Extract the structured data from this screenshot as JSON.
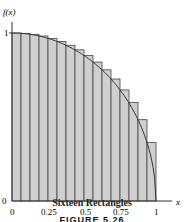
{
  "chart_data": {
    "type": "bar",
    "title": "Sixteen Rectangles",
    "function": "f(x) = sqrt(1 - x^2)",
    "xlabel": "x",
    "ylabel": "f(x)",
    "xlim": [
      0,
      1
    ],
    "ylim": [
      0,
      1
    ],
    "x_ticks": [
      "0",
      "0.25",
      "0.5",
      "0.75",
      "1"
    ],
    "y_ticks": [
      "0",
      "1"
    ],
    "rect_left_x": [
      0,
      0.0625,
      0.125,
      0.1875,
      0.25,
      0.3125,
      0.375,
      0.4375,
      0.5,
      0.5625,
      0.625,
      0.6875,
      0.75,
      0.8125,
      0.875,
      0.9375
    ],
    "rect_width": 0.0625,
    "values": [
      1.0,
      0.998,
      0.992,
      0.982,
      0.968,
      0.95,
      0.927,
      0.9,
      0.866,
      0.827,
      0.781,
      0.726,
      0.661,
      0.586,
      0.484,
      0.348
    ],
    "grid": false,
    "fill_color": "#cfcfcf"
  },
  "labels": {
    "ylabel": "f(x)",
    "xlabel": "x",
    "y_one": "1",
    "y_zero": "0",
    "x0": "0",
    "x025": "0.25",
    "x05": "0.5",
    "x075": "0.75",
    "x1": "1",
    "caption": "Sixteen Rectangles",
    "figure": "FIGURE 5.26"
  }
}
